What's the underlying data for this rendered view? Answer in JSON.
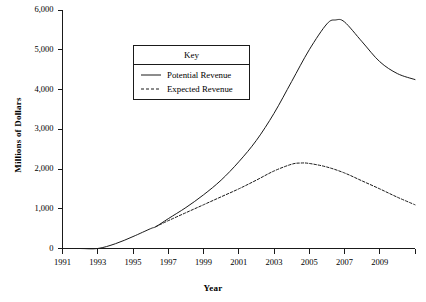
{
  "chart_data": {
    "type": "line",
    "title": "",
    "xlabel": "Year",
    "ylabel": "Millions of Dollars",
    "xlim": [
      1991,
      2011
    ],
    "ylim": [
      0,
      6000
    ],
    "grid": false,
    "legend_position": "upper-left-inside",
    "legend_title": "Key",
    "x_ticks": [
      1991,
      1993,
      1995,
      1997,
      1999,
      2001,
      2003,
      2005,
      2007,
      2009,
      2011
    ],
    "x_tick_labels": [
      "1991",
      "1993",
      "1995",
      "1997",
      "1999",
      "2001",
      "2003",
      "2005",
      "2007",
      "2009",
      ""
    ],
    "y_ticks": [
      0,
      1000,
      2000,
      3000,
      4000,
      5000,
      6000
    ],
    "y_tick_labels": [
      "0",
      "1,000",
      "2,000",
      "3,000",
      "4,000",
      "5,000",
      "6,000"
    ],
    "series": [
      {
        "name": "Potential Revenue",
        "style": "solid",
        "color": "#1a1a1a",
        "x": [
          1991,
          1992,
          1993,
          1994,
          1995,
          1996,
          1996.3,
          1997,
          1998,
          1999,
          2000,
          2001,
          2002,
          2003,
          2004,
          2005,
          2006,
          2006.5,
          2007,
          2008,
          2009,
          2010,
          2011
        ],
        "values": [
          0,
          0,
          0,
          120,
          300,
          500,
          550,
          750,
          1030,
          1350,
          1720,
          2180,
          2720,
          3400,
          4200,
          5000,
          5650,
          5750,
          5700,
          5200,
          4700,
          4400,
          4250
        ]
      },
      {
        "name": "Expected Revenue",
        "style": "dashed",
        "color": "#1a1a1a",
        "x": [
          1996.3,
          1997,
          1998,
          1999,
          2000,
          2001,
          2002,
          2003,
          2004,
          2004.5,
          2005,
          2006,
          2007,
          2008,
          2009,
          2010,
          2011
        ],
        "values": [
          550,
          700,
          900,
          1100,
          1300,
          1500,
          1720,
          1950,
          2120,
          2150,
          2140,
          2050,
          1900,
          1700,
          1500,
          1290,
          1100
        ]
      }
    ]
  },
  "axis": {
    "y_title": "Millions of Dollars",
    "x_title": "Year"
  },
  "legend": {
    "title": "Key",
    "entries": [
      {
        "label": "Potential Revenue",
        "style": "solid"
      },
      {
        "label": "Expected Revenue",
        "style": "dashed"
      }
    ]
  }
}
